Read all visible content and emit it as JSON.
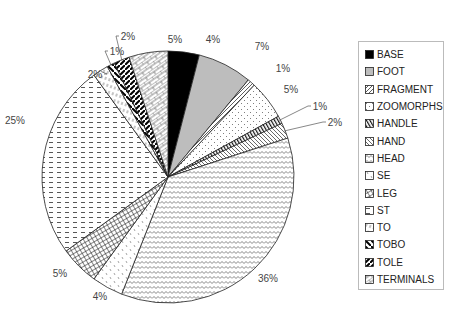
{
  "chart_data": {
    "type": "pie",
    "title": "",
    "start_angle_deg": 0,
    "direction": "clockwise",
    "categories": [
      "BASE",
      "FOOT",
      "FRAGMENT",
      "ZOOMORPHS",
      "HANDLE",
      "HAND",
      "HEAD",
      "SE",
      "LEG",
      "ST",
      "TO",
      "TOBO",
      "TOLE",
      "TERMINALS"
    ],
    "values": [
      4,
      7,
      1,
      5,
      1,
      2,
      36,
      4,
      5,
      25,
      2,
      1,
      2,
      5
    ],
    "labels": [
      "4%",
      "7%",
      "1%",
      "5%",
      "1%",
      "2%",
      "36%",
      "4%",
      "5%",
      "25%",
      "2%",
      "1%",
      "2%",
      "5%"
    ],
    "patterns": [
      "solid-black",
      "solid-gray",
      "diagonal-lines",
      "dots",
      "vertical-bars",
      "diagonal-lines-light",
      "zigzag",
      "sparse-dots",
      "crosshatch",
      "dashes",
      "dashed-vertical",
      "wide-diagonal",
      "thick-diagonal",
      "brick"
    ],
    "legend_position": "right"
  },
  "legend": {
    "items": [
      "BASE",
      "FOOT",
      "FRAGMENT",
      "ZOOMORPHS",
      "HANDLE",
      "HAND",
      "HEAD",
      "SE",
      "LEG",
      "ST",
      "TO",
      "TOBO",
      "TOLE",
      "TERMINALS"
    ]
  }
}
